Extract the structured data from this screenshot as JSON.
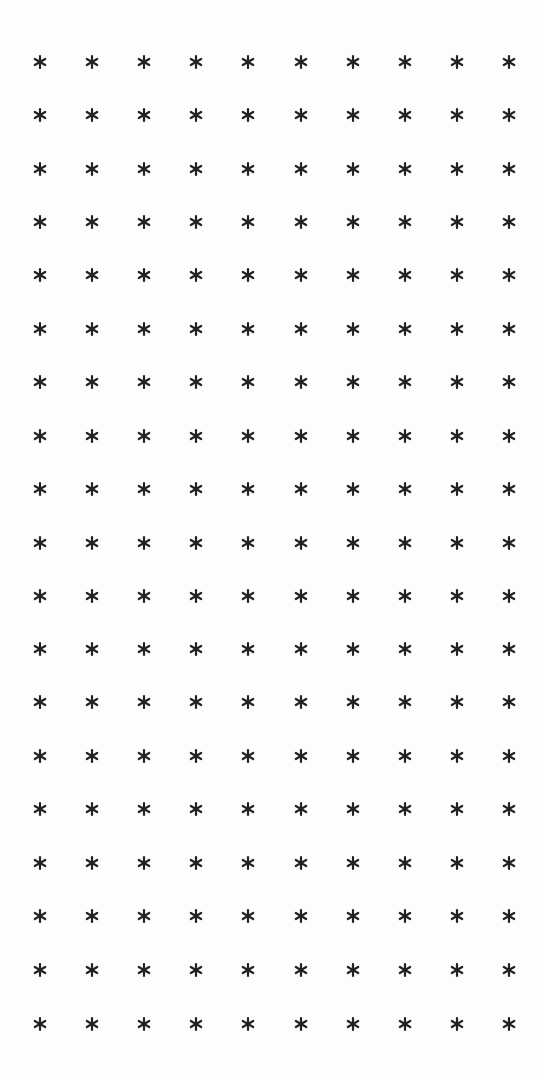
{
  "page": {
    "background": "#fdfdfd",
    "glyph_color": "#222222"
  },
  "grid": {
    "glyph": "*",
    "icon": "asterisk-icon",
    "rows": 19,
    "columns": 10,
    "column_x": [
      40,
      92,
      144,
      196,
      248,
      301,
      353,
      405,
      457,
      509
    ],
    "row_y": [
      62,
      115,
      169,
      222,
      275,
      329,
      382,
      436,
      489,
      543,
      596,
      649,
      702,
      756,
      809,
      863,
      916,
      970,
      1024
    ]
  }
}
